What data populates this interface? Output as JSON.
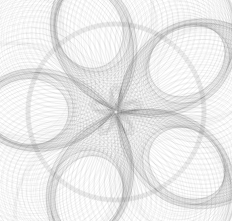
{
  "figure": {
    "title": "",
    "width": 232,
    "height": 221,
    "background_color": "#ffffff",
    "alt_text": "Dense monochrome envelope of circles forming a shaded disc with a five-petal rosette caustic at the center"
  },
  "chart_data": {
    "type": "line",
    "title": "",
    "subtitle": "",
    "xlabel": "",
    "ylabel": "",
    "grid": false,
    "legend": null,
    "legend_position": "none",
    "axes_visible": false,
    "tick_labels_x": [],
    "tick_labels_y": [],
    "xlim": [
      -1.35,
      1.35
    ],
    "ylim": [
      -1.28,
      1.28
    ],
    "aspect": "equal",
    "render": {
      "stroke_color": "#3a3a3a",
      "stroke_width": 0.35,
      "stroke_opacity": 0.17,
      "blend": "multiply",
      "background_color": "#ffffff"
    },
    "center_px": [
      116,
      112
    ],
    "outer_caustic_radius_px": 88,
    "inner_rosette_radius_px": 26,
    "petal_count": 5,
    "petal_angles_deg": [
      90,
      162,
      234,
      306,
      18
    ],
    "series": [
      {
        "name": "circle-envelope-family",
        "curve_type": "circle",
        "count": 220,
        "center_locus_radius": 1.0,
        "radius_base": 0.72,
        "radius_modulation_amplitude": 0.26,
        "radius_modulation_frequency": 5,
        "phase_start_deg": 0,
        "phase_step_deg": 1.6363636
      },
      {
        "name": "outer-caustic-ring",
        "curve_type": "circle",
        "count": 1,
        "radius": 1.0,
        "stroke_darkness": 0.55
      },
      {
        "name": "inner-rose-caustic",
        "curve_type": "rose",
        "count": 5,
        "petals": 5,
        "radius": 0.3,
        "stroke_darkness": 0.9
      }
    ]
  }
}
